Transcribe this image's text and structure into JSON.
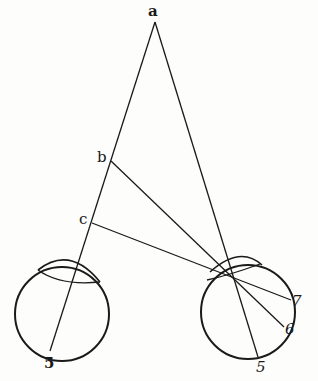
{
  "diagram": {
    "type": "geometric optics diagram — binocular convergence",
    "points": {
      "a": {
        "label": "a",
        "x": 155,
        "y": 22
      },
      "b": {
        "label": "b",
        "x": 111,
        "y": 161
      },
      "c": {
        "label": "c",
        "x": 92,
        "y": 223
      },
      "convergence": {
        "x": 235,
        "y": 280
      }
    },
    "left_eye": {
      "circle": {
        "cx": 62,
        "cy": 314,
        "r": 47
      },
      "bottom_label": "5"
    },
    "right_eye": {
      "circle": {
        "cx": 248,
        "cy": 312,
        "r": 47
      },
      "labels": [
        "7",
        "6",
        "5"
      ]
    },
    "colors": {
      "line": "#1a1a1a",
      "background": "#fdfdfc"
    }
  }
}
